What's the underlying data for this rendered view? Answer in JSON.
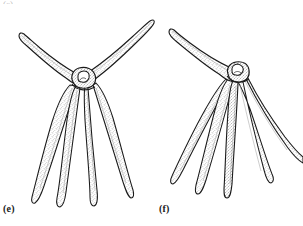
{
  "figure": {
    "kind": "scientific-line-drawing",
    "background_color": "#ffffff",
    "ink_color": "#1a1a1a",
    "stipple_color": "#6e6e6e",
    "width_px": 303,
    "height_px": 226,
    "top_cropped_text": "(c)"
  },
  "panels": [
    {
      "id": "e",
      "label": "(e)",
      "label_x": 3,
      "label_y": 203,
      "disc": {
        "cx": 83,
        "cy": 80,
        "rx": 10,
        "ry": 9
      },
      "arm_count": 6,
      "arms_up": 2,
      "arms_down": 4,
      "description": "Central disc with two arms raised laterally in a wide shallow V and four arms hanging downward and slightly splayed"
    },
    {
      "id": "f",
      "label": "(f)",
      "label_x": 159,
      "label_y": 203,
      "disc": {
        "cx": 236,
        "cy": 73,
        "rx": 9,
        "ry": 8
      },
      "arm_count": 6,
      "arms_up": 1,
      "arms_down": 5,
      "description": "Central disc with one arm raised to the upper left and five arms sweeping downward and outward in a fan"
    }
  ]
}
